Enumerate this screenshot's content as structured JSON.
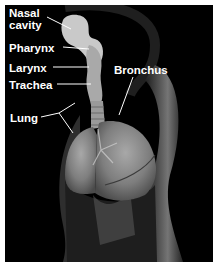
{
  "figure": {
    "background": "#000000",
    "frame_color": "#ffffff",
    "label_color": "#ffffff",
    "labels": [
      {
        "id": "nasal-cavity",
        "text_line1": "Nasal",
        "text_line2": "cavity"
      },
      {
        "id": "pharynx",
        "text": "Pharynx"
      },
      {
        "id": "larynx",
        "text": "Larynx"
      },
      {
        "id": "trachea",
        "text": "Trachea"
      },
      {
        "id": "bronchus",
        "text": "Bronchus"
      },
      {
        "id": "lung",
        "text": "Lung"
      }
    ]
  }
}
